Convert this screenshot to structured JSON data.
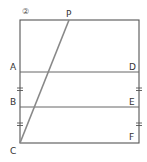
{
  "figure": {
    "number_label": "②",
    "stroke_color": "#555555",
    "line_color": "#666666",
    "diagonal_color": "#777777",
    "points": {
      "P": {
        "label": "P",
        "x": 69,
        "y": 20
      },
      "A": {
        "label": "A",
        "x": 20,
        "y": 72
      },
      "D": {
        "label": "D",
        "x": 139,
        "y": 72
      },
      "B": {
        "label": "B",
        "x": 20,
        "y": 107
      },
      "E": {
        "label": "E",
        "x": 139,
        "y": 107
      },
      "C": {
        "label": "C",
        "x": 20,
        "y": 143
      },
      "F": {
        "label": "F",
        "x": 139,
        "y": 143
      }
    },
    "segments": [
      "rectangle",
      "AD",
      "BE",
      "CP"
    ],
    "equal_marks": [
      "AB",
      "BC",
      "DE",
      "EF"
    ]
  }
}
